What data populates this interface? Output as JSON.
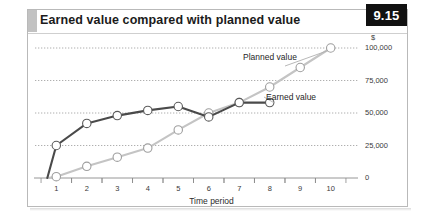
{
  "figure": {
    "number": "9.15",
    "title": "Earned value compared with planned value"
  },
  "chart_data": {
    "type": "line",
    "title": "Earned value compared with planned value",
    "xlabel": "Time period",
    "ylabel": "$",
    "x": [
      1,
      2,
      3,
      4,
      5,
      6,
      7,
      8,
      9,
      10
    ],
    "categories": [
      "1",
      "2",
      "3",
      "4",
      "5",
      "6",
      "7",
      "8",
      "9",
      "10"
    ],
    "xlim": [
      0.4,
      10.6
    ],
    "ylim": [
      0,
      100000
    ],
    "yticks": [
      0,
      25000,
      50000,
      75000,
      100000
    ],
    "ytick_labels": [
      "0",
      "25,000",
      "50,000",
      "75,000",
      "100,000"
    ],
    "y_unit": "$",
    "grid": "horizontal-dotted",
    "legend": "inline-annotations",
    "series": [
      {
        "name": "Earned value",
        "color": "#4a4a4a",
        "marker": "open-circle",
        "x": [
          1,
          2,
          3,
          4,
          5,
          6,
          7,
          8
        ],
        "values": [
          25000,
          42000,
          48000,
          52000,
          55000,
          47000,
          58000,
          58000
        ]
      },
      {
        "name": "Planned value",
        "color": "#c4c4c4",
        "marker": "open-circle",
        "x": [
          1,
          2,
          3,
          4,
          5,
          6,
          7,
          8,
          9,
          10
        ],
        "values": [
          1000,
          9000,
          16000,
          23000,
          37000,
          50000,
          58000,
          70000,
          85000,
          100000
        ]
      }
    ],
    "annotations": [
      {
        "text": "Planned value",
        "series": "Planned value"
      },
      {
        "text": "Earned value",
        "series": "Earned value"
      }
    ]
  },
  "axis": {
    "y_currency_symbol": "$",
    "y_labels": [
      "100,000",
      "75,000",
      "50,000",
      "25,000",
      "0"
    ],
    "x_labels": [
      "1",
      "2",
      "3",
      "4",
      "5",
      "6",
      "7",
      "8",
      "9",
      "10"
    ],
    "x_title": "Time period"
  },
  "colors": {
    "earned": "#4a4a4a",
    "planned": "#c4c4c4",
    "grid": "#9a9a9a",
    "frame": "#b9b9b9",
    "badge_bg": "#111111",
    "accent": "#c2c2c2"
  }
}
